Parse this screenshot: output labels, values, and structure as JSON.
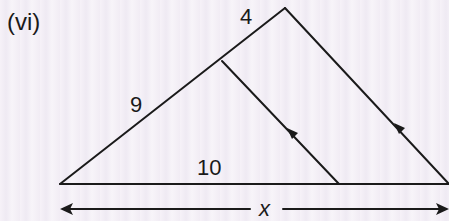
{
  "figure": {
    "part_label": "(vi)",
    "labels": {
      "side_upper": "4",
      "side_lower": "9",
      "base_segment": "10",
      "total_base": "x"
    },
    "parallel_marks": "single arrow on each of the two parallel lines",
    "colors": {
      "line": "#1a1a1a",
      "background": "#f4f0f6"
    }
  }
}
